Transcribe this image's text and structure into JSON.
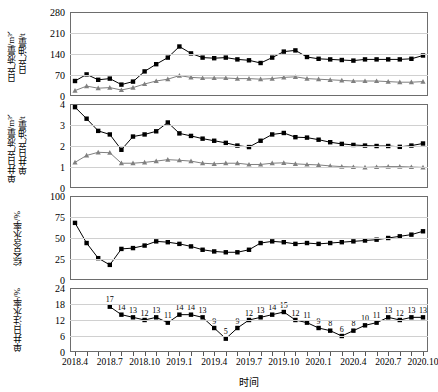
{
  "figure": {
    "xlabel": "时间",
    "x_tick_labels": [
      "2018.4",
      "2018.7",
      "2018.10",
      "2019.1",
      "2019.4",
      "2019.7",
      "2019.10",
      "2020.1",
      "2020.4",
      "2020.7",
      "2020.10"
    ],
    "x_tick_index": [
      0,
      3,
      6,
      9,
      12,
      15,
      18,
      21,
      24,
      27,
      30
    ],
    "n_points": 31,
    "colors": {
      "liquid": "#000000",
      "oil": "#808080",
      "line_gray": "#707070",
      "grid": "#d0d0d0",
      "axis": "#6d6d6d"
    }
  },
  "chart_data": [
    {
      "type": "line",
      "panel": 1,
      "ylabel": "日产液量/m³、\n日产油量/t",
      "ylabel_line1": "日产液量/m³、",
      "ylabel_line2": "日产油量/t",
      "ylim": [
        0,
        280
      ],
      "yticks": [
        0,
        70,
        140,
        210,
        280
      ],
      "xlabel": "",
      "grid": true,
      "x": [
        "2018.4",
        "2018.5",
        "2018.6",
        "2018.7",
        "2018.8",
        "2018.9",
        "2018.10",
        "2018.11",
        "2018.12",
        "2019.1",
        "2019.2",
        "2019.3",
        "2019.4",
        "2019.5",
        "2019.6",
        "2019.7",
        "2019.8",
        "2019.9",
        "2019.10",
        "2019.11",
        "2019.12",
        "2020.1",
        "2020.2",
        "2020.3",
        "2020.4",
        "2020.5",
        "2020.6",
        "2020.7",
        "2020.8",
        "2020.9",
        "2020.10"
      ],
      "series": [
        {
          "name": "日产液量/m³",
          "marker": "square",
          "color": "#000000",
          "values": [
            50,
            72,
            54,
            58,
            38,
            48,
            82,
            106,
            128,
            165,
            142,
            128,
            126,
            128,
            122,
            119,
            110,
            128,
            148,
            152,
            130,
            124,
            122,
            120,
            118,
            122,
            122,
            122,
            122,
            124,
            135
          ]
        },
        {
          "name": "日产油量/t",
          "marker": "triangle",
          "color": "#808080",
          "values": [
            18,
            33,
            26,
            28,
            20,
            28,
            40,
            50,
            56,
            68,
            62,
            60,
            60,
            60,
            58,
            58,
            56,
            58,
            62,
            64,
            58,
            56,
            54,
            52,
            50,
            50,
            50,
            48,
            46,
            46,
            48
          ]
        }
      ]
    },
    {
      "type": "line",
      "panel": 2,
      "ylabel_line1": "单井日产液量/m³、",
      "ylabel_line2": "单井日产油量/t",
      "ylim": [
        0,
        4
      ],
      "yticks": [
        0,
        1,
        2,
        3,
        4
      ],
      "grid": true,
      "x": [
        "2018.4",
        "2018.5",
        "2018.6",
        "2018.7",
        "2018.8",
        "2018.9",
        "2018.10",
        "2018.11",
        "2018.12",
        "2019.1",
        "2019.2",
        "2019.3",
        "2019.4",
        "2019.5",
        "2019.6",
        "2019.7",
        "2019.8",
        "2019.9",
        "2019.10",
        "2019.11",
        "2019.12",
        "2020.1",
        "2020.2",
        "2020.3",
        "2020.4",
        "2020.5",
        "2020.6",
        "2020.7",
        "2020.8",
        "2020.9",
        "2020.10"
      ],
      "series": [
        {
          "name": "单井日产液量/m³",
          "marker": "square",
          "color": "#000000",
          "values": [
            3.85,
            3.3,
            2.72,
            2.55,
            1.82,
            2.45,
            2.55,
            2.7,
            3.12,
            2.6,
            2.48,
            2.35,
            2.25,
            2.15,
            2.02,
            1.95,
            2.25,
            2.55,
            2.62,
            2.42,
            2.4,
            2.3,
            2.18,
            2.1,
            2.05,
            2.02,
            2.0,
            2.0,
            1.96,
            2.02,
            2.12
          ]
        },
        {
          "name": "单井日产油量/t",
          "marker": "triangle",
          "color": "#808080",
          "values": [
            1.22,
            1.55,
            1.7,
            1.68,
            1.18,
            1.18,
            1.22,
            1.28,
            1.35,
            1.32,
            1.28,
            1.18,
            1.15,
            1.18,
            1.18,
            1.12,
            1.12,
            1.18,
            1.2,
            1.15,
            1.12,
            1.1,
            1.05,
            1.02,
            1.0,
            0.98,
            1.0,
            1.02,
            1.02,
            1.0,
            0.98
          ]
        }
      ]
    },
    {
      "type": "line",
      "panel": 3,
      "ylabel_line1": "综合含水率/%",
      "ylim": [
        0,
        100
      ],
      "yticks": [
        0,
        25,
        50,
        75,
        100
      ],
      "grid": true,
      "x": [
        "2018.4",
        "2018.5",
        "2018.6",
        "2018.7",
        "2018.8",
        "2018.9",
        "2018.10",
        "2018.11",
        "2018.12",
        "2019.1",
        "2019.2",
        "2019.3",
        "2019.4",
        "2019.5",
        "2019.6",
        "2019.7",
        "2019.8",
        "2019.9",
        "2019.10",
        "2019.11",
        "2019.12",
        "2020.1",
        "2020.2",
        "2020.3",
        "2020.4",
        "2020.5",
        "2020.6",
        "2020.7",
        "2020.8",
        "2020.9",
        "2020.10"
      ],
      "series": [
        {
          "name": "综合含水率/%",
          "marker": "square",
          "color": "#000000",
          "values": [
            68,
            44,
            26,
            18,
            37,
            38,
            41,
            46,
            45,
            43,
            40,
            36,
            34,
            33,
            33,
            36,
            44,
            46,
            45,
            43,
            44,
            43,
            44,
            45,
            46,
            47,
            48,
            50,
            52,
            54,
            58
          ]
        }
      ]
    },
    {
      "type": "line",
      "panel": 4,
      "ylabel_line1": "单井日注水率/%",
      "ylim": [
        0,
        24
      ],
      "yticks": [
        0,
        6,
        12,
        18,
        24
      ],
      "grid": true,
      "x": [
        "2018.4",
        "2018.5",
        "2018.6",
        "2018.7",
        "2018.8",
        "2018.9",
        "2018.10",
        "2018.11",
        "2018.12",
        "2019.1",
        "2019.2",
        "2019.3",
        "2019.4",
        "2019.5",
        "2019.6",
        "2019.7",
        "2019.8",
        "2019.9",
        "2019.10",
        "2019.11",
        "2019.12",
        "2020.1",
        "2020.2",
        "2020.3",
        "2020.4",
        "2020.5",
        "2020.6",
        "2020.7",
        "2020.8",
        "2020.9",
        "2020.10"
      ],
      "series": [
        {
          "name": "单井日注水率/%",
          "marker": "square",
          "color": "#000000",
          "values": [
            null,
            null,
            null,
            17,
            14,
            13,
            12,
            13,
            11,
            14,
            14,
            13,
            9,
            5,
            9,
            12,
            13,
            14,
            15,
            12,
            11,
            9,
            8,
            6,
            8,
            10,
            11,
            13,
            12,
            13,
            13
          ],
          "data_labels": [
            null,
            null,
            null,
            "17",
            "14",
            "13",
            "12",
            "13",
            "11",
            "14",
            "14",
            "13",
            "9",
            "5",
            "9",
            "12",
            "13",
            "14",
            "15",
            "12",
            "11",
            "9",
            "8",
            "6",
            "8",
            "10",
            "11",
            "13",
            "12",
            "13",
            "13"
          ]
        }
      ]
    }
  ]
}
